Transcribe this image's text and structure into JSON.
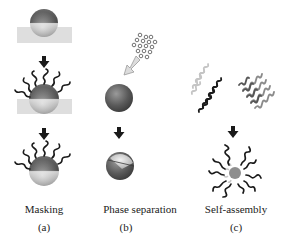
{
  "diagram": {
    "panels": [
      {
        "id": "a",
        "caption": "Masking",
        "letter": "(a)",
        "steps": [
          "particle-on-substrate",
          "grafted-chains-on-exposed-half",
          "janus-particle-with-chains"
        ]
      },
      {
        "id": "b",
        "caption": "Phase separation",
        "letter": "(b)",
        "steps": [
          "monomer-droplets",
          "homogeneous-particle",
          "phase-separated-janus-particle"
        ]
      },
      {
        "id": "c",
        "caption": "Self-assembly",
        "letter": "(c)",
        "steps": [
          "block-copolymer-chains-light-black",
          "block-copolymer-chains-gray",
          "janus-micelle"
        ]
      }
    ],
    "colors": {
      "sphere_dark": "#555555",
      "sphere_light": "#bdbdbd",
      "substrate": "#dedede",
      "chain_black": "#1a1a1a",
      "chain_gray": "#6e6e6e",
      "chain_light": "#c4c4c4",
      "arrow": "#1a1a1a",
      "hollow_arrow": "#d9d9d9"
    }
  }
}
